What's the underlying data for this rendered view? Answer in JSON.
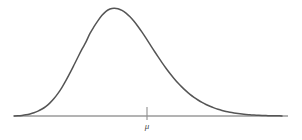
{
  "figure": {
    "background_color": "#ffffff",
    "width": 302,
    "height": 140
  },
  "chart_data": {
    "type": "line",
    "title": "",
    "subtitle": "",
    "xlabel": "",
    "ylabel": "",
    "grid": false,
    "legend": null,
    "axis": {
      "name": "horizontal-axis",
      "color": "#9a9a9a",
      "x_start": 14,
      "x_end": 288,
      "y": 116,
      "stroke_width": 1.6
    },
    "ticks": [
      {
        "label": "μ",
        "label_name": "mu",
        "x": 147,
        "top": 107,
        "bottom": 120,
        "label_y": 129,
        "color": "#8f8f8f"
      }
    ],
    "series": [
      {
        "name": "density-curve",
        "color": "#555555",
        "stroke_width": 1.5,
        "peak": {
          "x": 110,
          "y": 9
        },
        "points": [
          [
            14,
            116.0
          ],
          [
            18,
            115.8
          ],
          [
            22,
            115.4
          ],
          [
            26,
            114.8
          ],
          [
            30,
            113.9
          ],
          [
            34,
            112.7
          ],
          [
            38,
            111.1
          ],
          [
            42,
            109.0
          ],
          [
            46,
            106.3
          ],
          [
            50,
            102.9
          ],
          [
            54,
            98.6
          ],
          [
            58,
            93.4
          ],
          [
            62,
            87.3
          ],
          [
            66,
            80.4
          ],
          [
            70,
            72.9
          ],
          [
            74,
            65.0
          ],
          [
            78,
            57.0
          ],
          [
            82,
            49.2
          ],
          [
            86,
            41.9
          ],
          [
            90,
            33.4
          ],
          [
            94,
            26.7
          ],
          [
            98,
            20.6
          ],
          [
            102,
            15.3
          ],
          [
            106,
            11.3
          ],
          [
            110,
            9.0
          ],
          [
            114,
            8.2
          ],
          [
            118,
            8.7
          ],
          [
            122,
            10.4
          ],
          [
            126,
            13.1
          ],
          [
            130,
            16.8
          ],
          [
            134,
            21.3
          ],
          [
            138,
            26.5
          ],
          [
            142,
            32.2
          ],
          [
            146,
            38.2
          ],
          [
            150,
            44.4
          ],
          [
            154,
            50.6
          ],
          [
            158,
            56.7
          ],
          [
            162,
            62.6
          ],
          [
            166,
            68.2
          ],
          [
            170,
            73.5
          ],
          [
            174,
            78.4
          ],
          [
            178,
            83.0
          ],
          [
            182,
            87.1
          ],
          [
            186,
            90.9
          ],
          [
            190,
            94.3
          ],
          [
            194,
            97.3
          ],
          [
            198,
            100.0
          ],
          [
            202,
            102.4
          ],
          [
            206,
            104.5
          ],
          [
            210,
            106.3
          ],
          [
            214,
            107.9
          ],
          [
            218,
            109.3
          ],
          [
            222,
            110.5
          ],
          [
            226,
            111.5
          ],
          [
            230,
            112.3
          ],
          [
            234,
            113.0
          ],
          [
            238,
            113.6
          ],
          [
            242,
            114.1
          ],
          [
            246,
            114.5
          ],
          [
            250,
            114.8
          ],
          [
            254,
            115.1
          ],
          [
            258,
            115.3
          ],
          [
            262,
            115.5
          ],
          [
            266,
            115.6
          ],
          [
            270,
            115.7
          ],
          [
            274,
            115.8
          ],
          [
            278,
            115.85
          ],
          [
            282,
            115.9
          ]
        ]
      }
    ],
    "xlim": [
      0,
      302
    ],
    "ylim": [
      0,
      140
    ]
  }
}
